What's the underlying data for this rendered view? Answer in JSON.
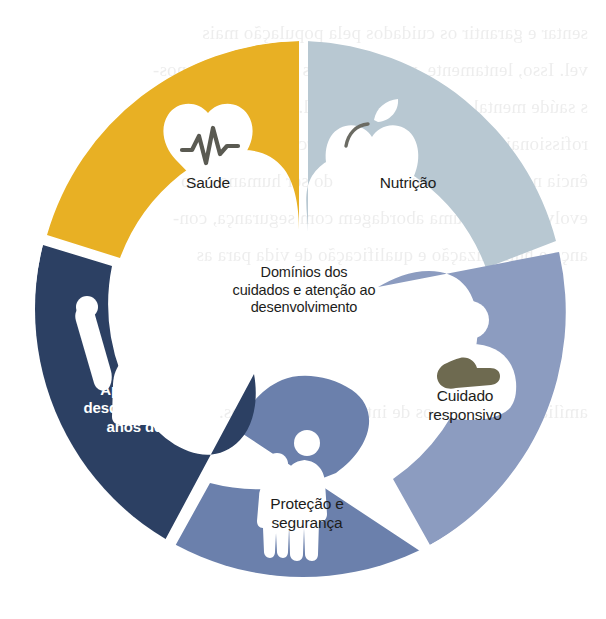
{
  "figure": {
    "name": "nurturing-care-framework-wheel",
    "center_label": "Domínios dos\ncuidados e atenção ao\ndesenvolvimento",
    "background_color": "#ffffff",
    "center_color": "#f5f2e0"
  },
  "segments": [
    {
      "id": "saude",
      "label": "Saúde",
      "icon": "heart-pulse-icon",
      "color": "#e8b024",
      "text_color": "#1d1d1b",
      "position": "top-left"
    },
    {
      "id": "nutricao",
      "label": "Nutrição",
      "icon": "apple-icon",
      "color": "#b8c8d2",
      "text_color": "#1d1d1b",
      "position": "top-right"
    },
    {
      "id": "cuidado-responsivo",
      "label": "Cuidado\nresponsivo",
      "icon": "caregiver-holding-baby-icon",
      "color": "#8c9cc0",
      "text_color": "#1d1d1b",
      "position": "right"
    },
    {
      "id": "protecao-seguranca",
      "label": "Proteção e\nsegurança",
      "icon": "adult-and-child-icon",
      "color": "#6b80ac",
      "text_color": "#1d1d1b",
      "position": "bottom"
    },
    {
      "id": "aprendizagem",
      "label": "Aprendizagem\ndesde os primeiros\nanos de vida",
      "icon": "person-raised-hand-icon",
      "color": "#2c4063",
      "text_color": "#ffffff",
      "position": "left"
    }
  ],
  "bleed_through_lines": [
    "sentar e garantir os cuidados pela população mais",
    "vel. Isso, lentamente, passou a ser as mudanças em nos-",
    "s saúde mental e na forma relacional. No currículo dos",
    "rofissionais de saúde vem sendo percebidas como e excel",
    "ência no processo de tratamento do ser humano e do",
    "evolvimento de uma abordagem com segurança, con-",
    "ança e humanização e qualificação de vida para as",
    "amílias e seus núcleos de interrelacionamentos."
  ]
}
